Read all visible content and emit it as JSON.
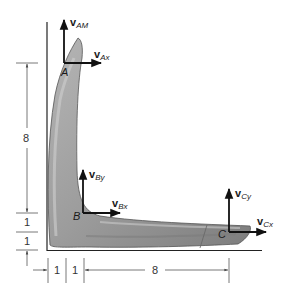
{
  "diagram": {
    "points": [
      {
        "id": "A",
        "label": "A"
      },
      {
        "id": "B",
        "label": "B"
      },
      {
        "id": "C",
        "label": "C"
      }
    ],
    "vectors": {
      "A_vertical": {
        "main": "v",
        "sub": "AM"
      },
      "A_horizontal": {
        "main": "v",
        "sub": "Ax"
      },
      "B_vertical": {
        "main": "v",
        "sub": "By"
      },
      "B_horizontal": {
        "main": "v",
        "sub": "Bx"
      },
      "C_vertical": {
        "main": "v",
        "sub": "Cy"
      },
      "C_horizontal": {
        "main": "v",
        "sub": "Cx"
      }
    },
    "dimensions": {
      "left": [
        "8",
        "1",
        "1"
      ],
      "bottom": [
        "1",
        "1",
        "8"
      ]
    },
    "colors": {
      "body_fill": "#9a9a9a",
      "body_highlight": "#c4c4c4",
      "body_shadow": "#6f6f6f",
      "lines": "#1a1a1a",
      "dim_lines": "#555555"
    }
  }
}
